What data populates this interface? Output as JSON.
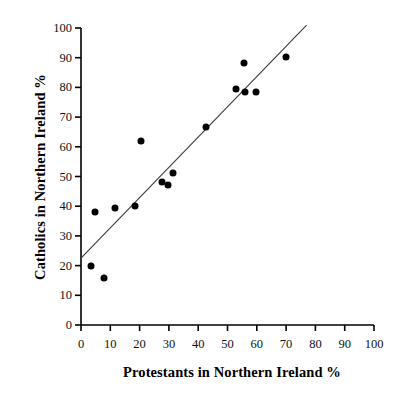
{
  "chart_data": {
    "type": "scatter",
    "title": "",
    "xlabel": "Protestants in Northern Ireland %",
    "ylabel": "Catholics in Northern Ireland %",
    "xlim": [
      0,
      100
    ],
    "ylim": [
      0,
      100
    ],
    "xticks": [
      0,
      10,
      20,
      30,
      40,
      50,
      60,
      70,
      80,
      90,
      100
    ],
    "yticks": [
      0,
      10,
      20,
      30,
      40,
      50,
      60,
      70,
      80,
      90,
      100
    ],
    "xtick_labels": [
      "0",
      "10",
      "20",
      "30",
      "40",
      "50",
      "60",
      "70",
      "80",
      "90",
      "100"
    ],
    "ytick_labels": [
      "0",
      "10",
      "20",
      "30",
      "40",
      "50",
      "60",
      "70",
      "80",
      "90",
      "100"
    ],
    "grid": false,
    "legend": null,
    "marker": "filled-circle",
    "marker_color": "#000000",
    "axis_color": "#000000",
    "points": [
      {
        "x": 3.4,
        "y": 20.0
      },
      {
        "x": 4.8,
        "y": 38.2
      },
      {
        "x": 7.8,
        "y": 15.9
      },
      {
        "x": 11.6,
        "y": 39.3
      },
      {
        "x": 18.5,
        "y": 40.2
      },
      {
        "x": 20.5,
        "y": 62.0
      },
      {
        "x": 27.5,
        "y": 48.2
      },
      {
        "x": 29.8,
        "y": 47.3
      },
      {
        "x": 31.5,
        "y": 51.2
      },
      {
        "x": 42.5,
        "y": 66.5
      },
      {
        "x": 52.8,
        "y": 79.4
      },
      {
        "x": 55.5,
        "y": 88.2
      },
      {
        "x": 56.0,
        "y": 78.5
      },
      {
        "x": 59.7,
        "y": 78.6
      },
      {
        "x": 69.8,
        "y": 90.4
      }
    ],
    "fit_line": {
      "type": "linear-regression",
      "color": "#3a3a3a",
      "x_start": 0.0,
      "y_start": 22.5,
      "x_end": 77.0,
      "y_end": 101.0
    }
  }
}
